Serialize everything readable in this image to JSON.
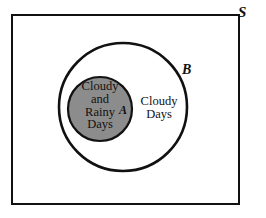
{
  "figure": {
    "type": "venn-diagram",
    "universe_label": "S",
    "outer_set_label": "B",
    "inner_set_label": "A",
    "outer_set_text": "Cloudy\nDays",
    "inner_set_text": "Cloudy\nand\nRainy\nDays"
  },
  "colors": {
    "background": "#ffffff",
    "stroke": "#111111",
    "inner_fill": "#8c8c8c",
    "text": "#111111"
  },
  "geometry": {
    "rect": {
      "x": 11,
      "y": 14,
      "width": 229,
      "height": 191,
      "stroke_width": 2
    },
    "outer_circle": {
      "cx": 123,
      "cy": 107,
      "r": 64,
      "stroke_width": 2.6
    },
    "inner_circle": {
      "cx": 100,
      "cy": 109,
      "r": 32,
      "stroke_width": 2.2
    }
  }
}
